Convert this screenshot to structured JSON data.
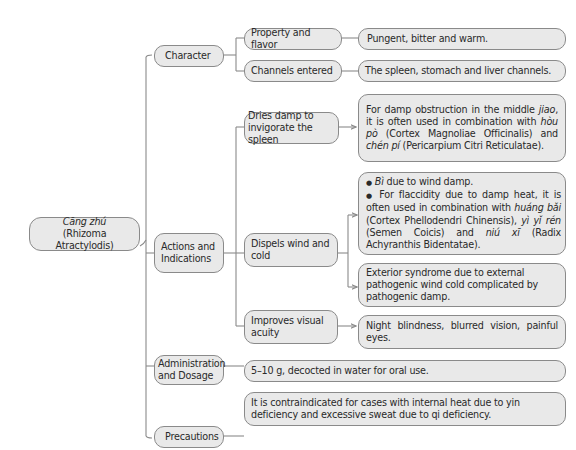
{
  "root": {
    "title_italic": "Cāng zhú",
    "subtitle": "(Rhizoma Atractylodis)"
  },
  "branches": [
    {
      "label": "Character",
      "children": [
        {
          "label": "Property and flavor",
          "detail": "Pungent, bitter and warm."
        },
        {
          "label": "Channels entered",
          "detail": "The spleen, stomach and liver channels."
        }
      ]
    },
    {
      "label": "Actions and Indications",
      "children": [
        {
          "label": "Dries damp to invigorate the spleen",
          "detail_parts": [
            "For damp obstruction in the middle ",
            "jiao",
            ", it is often used in combination with ",
            "hòu pò",
            " (Cortex Magnoliae Officinalis) and ",
            "chén pí",
            " (Pericarpium Citri Reticulatae)."
          ]
        },
        {
          "label": "Dispels wind and cold",
          "details": [
            {
              "bullet": "●",
              "parts": [
                "Bì",
                " due to wind damp."
              ]
            },
            {
              "bullet": "●",
              "parts": [
                " For flaccidity due to damp heat, it is often used in combination with ",
                "huáng bǎi",
                " (Cortex Phellodendri Chinensis), ",
                "yì yǐ rén",
                " (Semen Coicis) and ",
                "niú xī",
                " (Radix Achyranthis Bidentatae)."
              ]
            }
          ],
          "detail2": "Exterior syndrome due to external pathogenic wind cold complicated by pathogenic damp."
        },
        {
          "label": "Improves visual acuity",
          "detail": "Night blindness, blurred vision, painful eyes."
        }
      ]
    },
    {
      "label": "Administration and Dosage",
      "detail": "5–10 g, decocted in water for oral use."
    },
    {
      "label": "Precautions",
      "detail": "It is contraindicated for cases with internal heat due to yin deficiency and excessive sweat due to qi deficiency."
    }
  ]
}
